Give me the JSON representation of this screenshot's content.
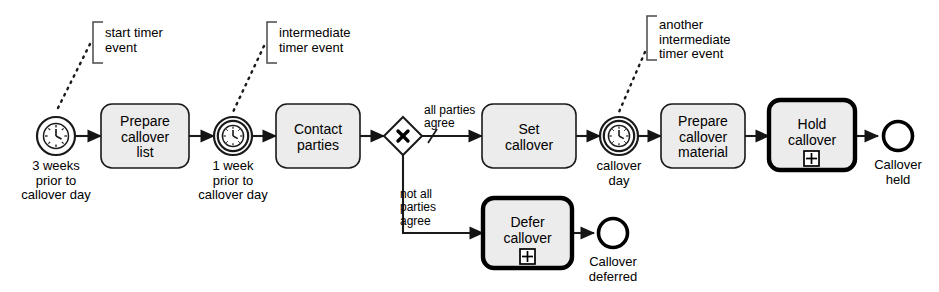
{
  "diagram": {
    "type": "BPMN process diagram",
    "notation": "BPMN",
    "colors": {
      "stroke": "#1a1a1a",
      "task_fill": "#ececec",
      "canvas": "#ffffff",
      "subprocess_stroke": "#000000"
    }
  },
  "events": [
    {
      "id": "start-timer",
      "kind": "start-timer-event",
      "icon": "clock-icon",
      "label": "3 weeks\nprior to\ncallover day"
    },
    {
      "id": "intermediate-timer-1",
      "kind": "intermediate-timer-event",
      "icon": "clock-icon",
      "label": "1 week\nprior to\ncallover day"
    },
    {
      "id": "intermediate-timer-2",
      "kind": "intermediate-timer-event",
      "icon": "clock-icon",
      "label": "callover\nday"
    },
    {
      "id": "end-callover-held",
      "kind": "end-event",
      "icon": "end-event-icon",
      "label": "Callover\nheld"
    },
    {
      "id": "end-callover-deferred",
      "kind": "end-event",
      "icon": "end-event-icon",
      "label": "Callover\ndeferred"
    }
  ],
  "tasks": [
    {
      "id": "prepare-callover-list",
      "label": "Prepare\ncallover\nlist",
      "style": "task",
      "marker": null
    },
    {
      "id": "contact-parties",
      "label": "Contact\nparties",
      "style": "task",
      "marker": null
    },
    {
      "id": "set-callover",
      "label": "Set\ncallover",
      "style": "task",
      "marker": null
    },
    {
      "id": "prepare-callover-material",
      "label": "Prepare\ncallover\nmaterial",
      "style": "task",
      "marker": null
    },
    {
      "id": "hold-callover",
      "label": "Hold\ncallover",
      "style": "collapsed-subprocess",
      "marker": "plus-marker"
    },
    {
      "id": "defer-callover",
      "label": "Defer\ncallover",
      "style": "collapsed-subprocess",
      "marker": "plus-marker"
    }
  ],
  "gateways": [
    {
      "id": "xor-gateway",
      "kind": "exclusive-gateway",
      "marker": "X"
    }
  ],
  "flows": [
    {
      "id": "flow-all-agree",
      "label": "all parties\nagree",
      "is_default": true
    },
    {
      "id": "flow-not-all-agree",
      "label": "not all\nparties\nagree",
      "is_default": false
    }
  ],
  "annotations": [
    {
      "id": "ann-start-timer",
      "text": "start timer\nevent"
    },
    {
      "id": "ann-intermediate-timer",
      "text": "intermediate\ntimer event"
    },
    {
      "id": "ann-another-intermediate-timer",
      "text": "another\nintermediate\ntimer event"
    }
  ]
}
